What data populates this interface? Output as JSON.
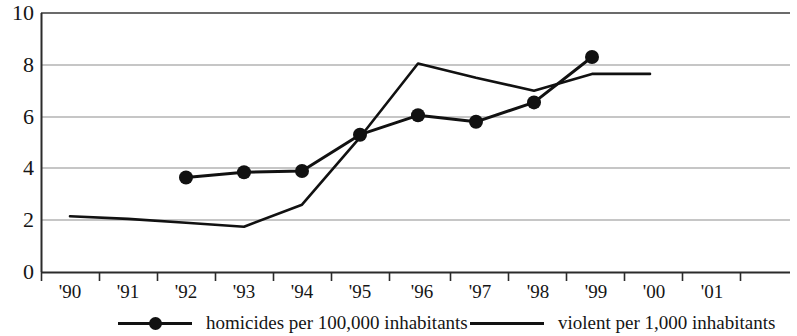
{
  "chart_data": {
    "type": "line",
    "title": "",
    "xlabel": "",
    "ylabel": "",
    "ylim": [
      0,
      10
    ],
    "yticks": [
      0,
      2,
      4,
      6,
      8,
      10
    ],
    "grid": true,
    "legend_position": "bottom",
    "categories": [
      "'90",
      "'91",
      "'92",
      "'93",
      "'94",
      "'95",
      "'96",
      "'97",
      "'98",
      "'99",
      "'00",
      "'01"
    ],
    "series": [
      {
        "name": "homicides per 100,000 inhabitants",
        "marker": "filled-circle",
        "values": [
          null,
          null,
          3.65,
          3.85,
          3.9,
          5.3,
          6.05,
          5.8,
          6.55,
          8.3,
          null,
          null
        ]
      },
      {
        "name": "violent per 1,000 inhabitants",
        "marker": "none",
        "values": [
          2.15,
          2.05,
          1.9,
          1.75,
          2.6,
          5.2,
          8.05,
          7.5,
          7.0,
          7.65,
          7.65,
          null
        ]
      }
    ]
  },
  "axis": {
    "y_tick_labels": [
      "10",
      "8",
      "6",
      "4",
      "2",
      "0"
    ],
    "x_tick_labels": [
      "'90",
      "'91",
      "'92",
      "'93",
      "'94",
      "'95",
      "'96",
      "'97",
      "'98",
      "'99",
      "'00",
      "'01"
    ]
  },
  "legend": {
    "entries": [
      {
        "label": "homicides per 100,000 inhabitants",
        "marker": "filled-circle"
      },
      {
        "label": "violent per 1,000 inhabitants",
        "marker": "none"
      }
    ]
  },
  "colors": {
    "line": "#111111",
    "grid": "#8a8a8a",
    "axis": "#2b2b2b",
    "text": "#151515",
    "background": "#ffffff"
  }
}
